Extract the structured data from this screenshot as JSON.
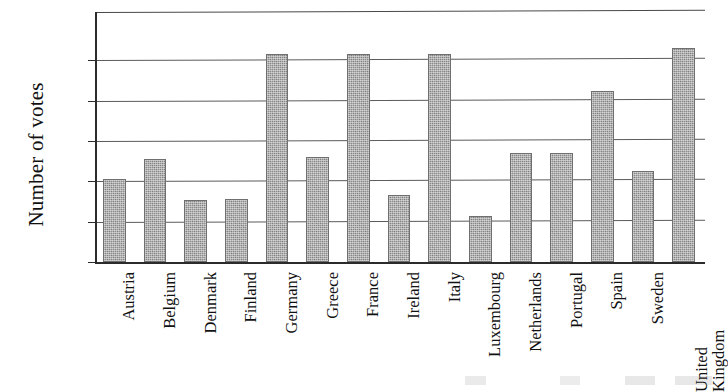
{
  "chart_data": {
    "type": "bar",
    "title": "",
    "xlabel": "",
    "ylabel": "Number of votes",
    "ylim": [
      0,
      12.4
    ],
    "yticks": [
      0,
      2,
      4,
      6,
      8,
      10
    ],
    "ytick_labels": [
      "0",
      "2",
      "4",
      "6",
      "8",
      "10"
    ],
    "grid": true,
    "legend": false,
    "bar_color": "#8d8d8d",
    "bar_edge_color": "#6f6f6f",
    "axis_color": "#2b2b2b",
    "categories": [
      "Austria",
      "Belgium",
      "Denmark",
      "Finland",
      "Germany",
      "Greece",
      "France",
      "Ireland",
      "Italy",
      "Luxembourg",
      "Netherlands",
      "Portugal",
      "Spain",
      "Sweden",
      "United Kingdom"
    ],
    "category_label_lines": [
      [
        "Austria"
      ],
      [
        "Belgium"
      ],
      [
        "Denmark"
      ],
      [
        "Finland"
      ],
      [
        "Germany"
      ],
      [
        "Greece"
      ],
      [
        "France"
      ],
      [
        "Ireland"
      ],
      [
        "Italy"
      ],
      [
        "Luxembourg"
      ],
      [
        "Netherlands"
      ],
      [
        "Portugal"
      ],
      [
        "Spain"
      ],
      [
        "Sweden"
      ],
      [
        "United",
        "Kingdom"
      ]
    ],
    "values": [
      4.1,
      5.1,
      3.1,
      3.15,
      10.3,
      5.2,
      10.3,
      3.3,
      10.3,
      2.3,
      5.4,
      5.4,
      8.5,
      4.5,
      10.6
    ]
  }
}
